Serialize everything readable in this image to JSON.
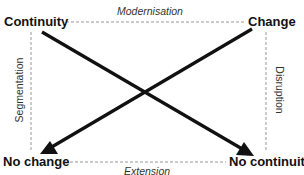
{
  "diagram": {
    "corners": {
      "top_left": "Continuity",
      "top_right": "Change",
      "bottom_left": "No change",
      "bottom_right": "No continuity"
    },
    "edges": {
      "top": "Modernisation",
      "bottom": "Extension",
      "left": "Segmentation",
      "right": "Disruption"
    },
    "arrows": [
      {
        "from": "Continuity",
        "to": "No continuity"
      },
      {
        "from": "Change",
        "to": "No change"
      }
    ],
    "colors": {
      "arrow": "#111111",
      "dashed_line": "#999999",
      "text": "#111111"
    }
  }
}
